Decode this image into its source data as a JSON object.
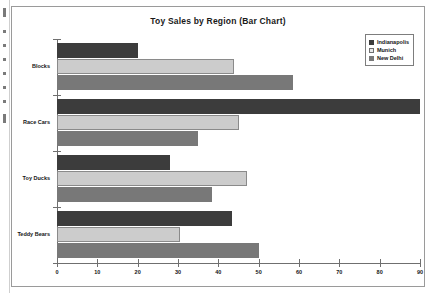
{
  "chart_data": {
    "type": "bar",
    "orientation": "horizontal",
    "title": "Toy Sales by Region (Bar Chart)",
    "xlabel": "",
    "ylabel": "",
    "categories": [
      "Blocks",
      "Race Cars",
      "Toy Ducks",
      "Teddy Bears"
    ],
    "series": [
      {
        "name": "Indianapolis",
        "color": "#3c3c3c",
        "values": [
          20,
          90,
          28,
          43.5
        ]
      },
      {
        "name": "Munich",
        "color": "#cccccc",
        "values": [
          44,
          45,
          47,
          30.5
        ]
      },
      {
        "name": "New Delhi",
        "color": "#787878",
        "values": [
          58.5,
          35,
          38.5,
          50
        ]
      }
    ],
    "xlim": [
      0,
      90
    ],
    "xticks": [
      0,
      10,
      20,
      30,
      40,
      50,
      60,
      70,
      80,
      90
    ],
    "xtick_labels": [
      "0",
      "10",
      "20",
      "30",
      "40",
      "50",
      "60",
      "70",
      "80",
      "90"
    ],
    "grid": false,
    "legend_position": "top-right"
  }
}
